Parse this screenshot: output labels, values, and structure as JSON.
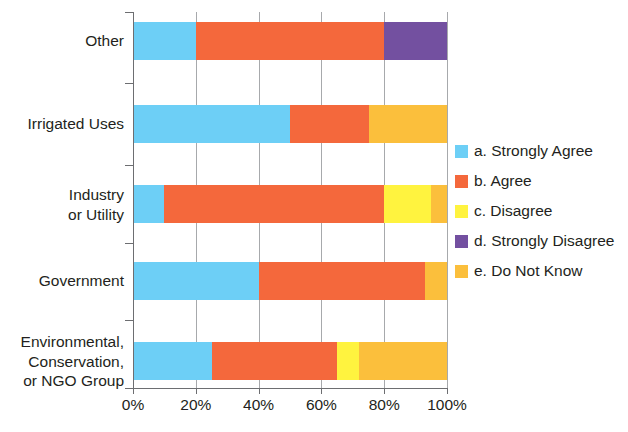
{
  "chart_data": {
    "type": "bar",
    "orientation": "horizontal",
    "stacked": true,
    "normalized_percent": true,
    "title": "",
    "subtitle": "",
    "xlabel": "",
    "ylabel": "",
    "xlim": [
      0,
      100
    ],
    "xticks": [
      0,
      20,
      40,
      60,
      80,
      100
    ],
    "xtick_labels": [
      "0%",
      "20%",
      "40%",
      "60%",
      "80%",
      "100%"
    ],
    "grid": true,
    "grid_axis": "x",
    "legend_position": "right",
    "categories": [
      "Other",
      "Irrigated Uses",
      "Industry\nor Utility",
      "Government",
      "Environmental,\nConservation,\nor NGO Group"
    ],
    "category_lines": [
      [
        "Other"
      ],
      [
        "Irrigated Uses"
      ],
      [
        "Industry",
        "or Utility"
      ],
      [
        "Government"
      ],
      [
        "Environmental,",
        "Conservation,",
        "or NGO Group"
      ]
    ],
    "series": [
      {
        "name": "a. Strongly Agree",
        "color": "#6dcff6",
        "values": [
          20,
          50,
          10,
          40,
          25
        ]
      },
      {
        "name": "b. Agree",
        "color": "#f4683c",
        "values": [
          60,
          25,
          70,
          53,
          40
        ]
      },
      {
        "name": "c. Disagree",
        "color": "#fff33f",
        "values": [
          0,
          0,
          15,
          0,
          7
        ]
      },
      {
        "name": "d. Strongly Disagree",
        "color": "#7350a0",
        "values": [
          20,
          0,
          0,
          0,
          0
        ]
      },
      {
        "name": "e. Do Not Know",
        "color": "#fbbf3c",
        "values": [
          0,
          25,
          5,
          7,
          28
        ]
      }
    ]
  },
  "legend": {
    "items": [
      {
        "label": "a. Strongly Agree",
        "color": "#6dcff6"
      },
      {
        "label": "b. Agree",
        "color": "#f4683c"
      },
      {
        "label": "c. Disagree",
        "color": "#fff33f"
      },
      {
        "label": "d. Strongly Disagree",
        "color": "#7350a0"
      },
      {
        "label": "e. Do Not Know",
        "color": "#fbbf3c"
      }
    ]
  },
  "axis": {
    "x_tick_labels": [
      "0%",
      "20%",
      "40%",
      "60%",
      "80%",
      "100%"
    ]
  }
}
